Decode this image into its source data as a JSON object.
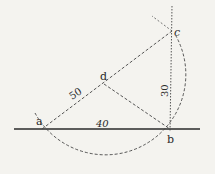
{
  "diagram": {
    "type": "geometry-construction",
    "points": {
      "a": {
        "label": "a",
        "x": 42,
        "y": 129
      },
      "b": {
        "label": "b",
        "x": 170,
        "y": 129
      },
      "c": {
        "label": "c",
        "x": 172,
        "y": 31
      },
      "d": {
        "label": "d",
        "x": 104,
        "y": 84
      }
    },
    "segment_labels": {
      "ad": "50",
      "ab": "40",
      "bc": "30"
    },
    "colors": {
      "ink": "#2a2a2a",
      "paper": "#f4f3ef"
    }
  }
}
